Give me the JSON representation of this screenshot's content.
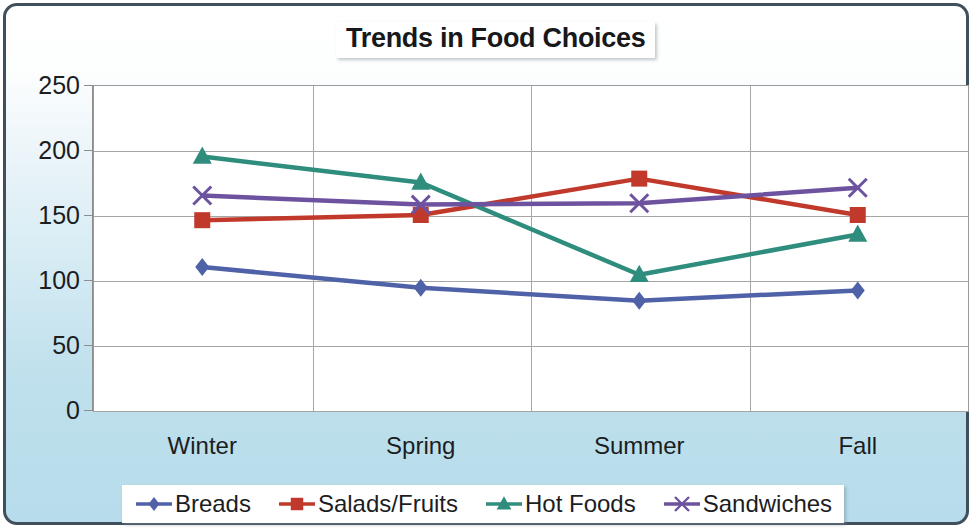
{
  "chart_data": {
    "type": "line",
    "title": "Trends in Food Choices",
    "xlabel": "",
    "ylabel": "",
    "categories": [
      "Winter",
      "Spring",
      "Summer",
      "Fall"
    ],
    "series": [
      {
        "name": "Breads",
        "values": [
          110,
          94,
          84,
          92
        ],
        "color": "#4f62a8",
        "marker": "diamond"
      },
      {
        "name": "Salads/Fruits",
        "values": [
          146,
          150,
          178,
          150
        ],
        "color": "#c0392b",
        "marker": "square"
      },
      {
        "name": "Hot Foods",
        "values": [
          195,
          175,
          104,
          135
        ],
        "color": "#2f8d7e",
        "marker": "triangle"
      },
      {
        "name": "Sandwiches",
        "values": [
          165,
          158,
          159,
          171
        ],
        "color": "#6d529f",
        "marker": "x"
      }
    ],
    "ylim": [
      0,
      250
    ],
    "yticks": [
      0,
      50,
      100,
      150,
      200,
      250
    ],
    "ytick_labels": [
      "0",
      "50",
      "100",
      "150",
      "200",
      "250"
    ],
    "grid": "both",
    "legend_position": "bottom"
  },
  "axes": {
    "y_labels": [
      "250",
      "200",
      "150",
      "100",
      "50",
      "0"
    ],
    "x_labels": [
      "Winter",
      "Spring",
      "Summer",
      "Fall"
    ]
  },
  "legend": {
    "entries": [
      {
        "label": "Breads",
        "marker": "diamond-marker",
        "color": "#4f62a8"
      },
      {
        "label": "Salads/Fruits",
        "marker": "square-marker",
        "color": "#c0392b"
      },
      {
        "label": "Hot Foods",
        "marker": "triangle-marker",
        "color": "#2f8d7e"
      },
      {
        "label": "Sandwiches",
        "marker": "x-marker",
        "color": "#6d529f"
      }
    ]
  },
  "colors": {
    "frame_border": "#3f4f5c",
    "background_top": "#ffffff",
    "background_bottom": "#b7dceb",
    "plot_background": "#ffffff",
    "gridline": "#a6a6a6",
    "text": "#1c1d1f"
  }
}
